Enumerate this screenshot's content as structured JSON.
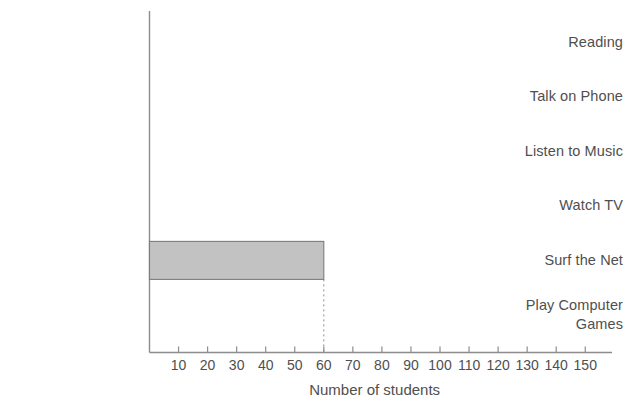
{
  "chart_data": {
    "type": "bar",
    "orientation": "horizontal",
    "title": "",
    "xlabel": "Number of students",
    "ylabel": "",
    "categories": [
      "Reading",
      "Talk on Phone",
      "Listen to Music",
      "Watch TV",
      "Surf the Net",
      "Play Computer\nGames"
    ],
    "values": [
      0,
      0,
      0,
      0,
      60,
      0
    ],
    "xlim": [
      0,
      155
    ],
    "xticks": [
      10,
      20,
      30,
      40,
      50,
      60,
      70,
      80,
      90,
      100,
      110,
      120,
      130,
      140,
      150
    ],
    "xtick_labels": [
      "10",
      "20",
      "30",
      "40",
      "50",
      "60",
      "70",
      "80",
      "90",
      "100",
      "110",
      "120",
      "130",
      "140",
      "150"
    ],
    "grid": false,
    "legend": false,
    "annotations": [
      {
        "kind": "drop-line",
        "style": "dotted",
        "x_value": 60,
        "from_category": "Surf the Net",
        "description": "dotted vertical guide from end of Surf the Net bar down to the 60 tick"
      }
    ],
    "bar_fill_color": "#c2c2c2",
    "bar_edge_color": "#7d7d7d",
    "axis_color": "#8c8c8c",
    "text_color": "#4f4f4f"
  }
}
